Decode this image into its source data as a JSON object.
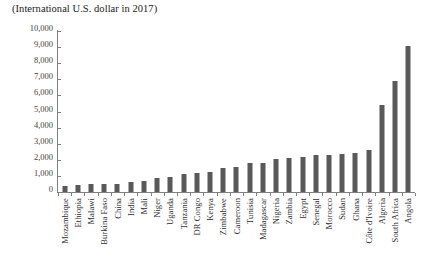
{
  "chart_data": {
    "type": "bar",
    "title": "(International U.S. dollar in 2017)",
    "subtitle": "",
    "xlabel": "",
    "ylabel": "",
    "ylim": [
      0,
      10000
    ],
    "ytick_values": [
      0,
      1000,
      2000,
      3000,
      4000,
      5000,
      6000,
      7000,
      8000,
      9000,
      10000
    ],
    "ytick_labels": [
      "0",
      "1,000",
      "2,000",
      "3,000",
      "4,000",
      "5,000",
      "6,000",
      "7,000",
      "8,000",
      "9,000",
      "10,000"
    ],
    "grid": false,
    "legend": null,
    "bar_color": "#595959",
    "axis_color": "#808080",
    "categories": [
      "Mozambique",
      "Ethiopia",
      "Malawi",
      "Burkina Faso",
      "China",
      "India",
      "Mali",
      "Niger",
      "Uganda",
      "Tanzania",
      "DR Congo",
      "Kenya",
      "Zimbabwe",
      "Cameroon",
      "Tunisia",
      "Madagascar",
      "Nigeria",
      "Zambia",
      "Egypt",
      "Senegal",
      "Morocco",
      "Sudan",
      "Ghana",
      "Côte d'Ivoire",
      "Algeria",
      "South Africa",
      "Angola"
    ],
    "values": [
      400,
      430,
      470,
      480,
      500,
      620,
      680,
      900,
      930,
      1150,
      1180,
      1250,
      1520,
      1550,
      1800,
      1820,
      2050,
      2100,
      2200,
      2280,
      2300,
      2380,
      2420,
      2600,
      5400,
      6900,
      9100
    ],
    "series": [
      {
        "name": "value",
        "values": [
          400,
          430,
          470,
          480,
          500,
          620,
          680,
          900,
          930,
          1150,
          1180,
          1250,
          1520,
          1550,
          1800,
          1820,
          2050,
          2100,
          2200,
          2280,
          2300,
          2380,
          2420,
          2600,
          5400,
          6900,
          9100
        ]
      }
    ]
  }
}
